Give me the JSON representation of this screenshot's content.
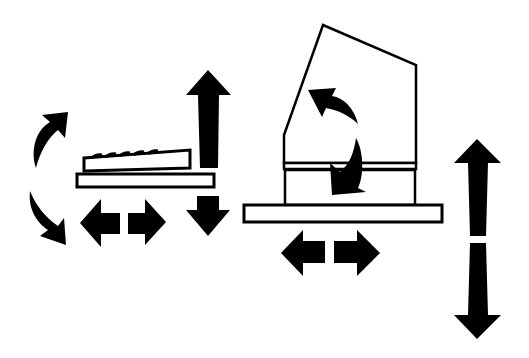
{
  "diagram": {
    "colors": {
      "ink": "#000000",
      "background": "#ffffff"
    },
    "elements": [
      {
        "name": "keyboard",
        "kind": "shape"
      },
      {
        "name": "keyboard-tray",
        "kind": "shape"
      },
      {
        "name": "keyboard-tilt-arrows",
        "kind": "curved-arrows"
      },
      {
        "name": "keyboard-horizontal-arrows",
        "kind": "double-arrow"
      },
      {
        "name": "keyboard-vertical-arrows",
        "kind": "double-arrow"
      },
      {
        "name": "monitor",
        "kind": "shape"
      },
      {
        "name": "monitor-stand",
        "kind": "shape"
      },
      {
        "name": "monitor-base-platform",
        "kind": "shape"
      },
      {
        "name": "monitor-tilt-arrows",
        "kind": "curved-arrows"
      },
      {
        "name": "monitor-horizontal-arrows",
        "kind": "double-arrow"
      },
      {
        "name": "monitor-vertical-arrows",
        "kind": "double-arrow"
      }
    ]
  }
}
